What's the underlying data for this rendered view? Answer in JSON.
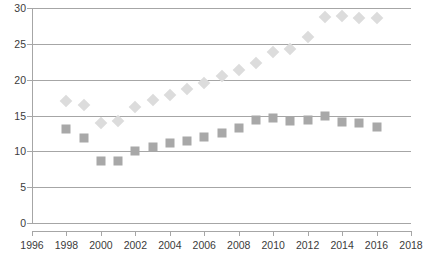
{
  "chart_data": {
    "type": "scatter",
    "title": "",
    "subtitle": "",
    "xlabel": "",
    "ylabel": "",
    "xlim": [
      1996,
      2018
    ],
    "ylim": [
      0,
      30
    ],
    "grid": true,
    "legend_position": "none",
    "x_ticks": [
      1996,
      1998,
      2000,
      2002,
      2004,
      2006,
      2008,
      2010,
      2012,
      2014,
      2016,
      2018
    ],
    "x_tick_labels": [
      "1996",
      "1998",
      "2000",
      "2002",
      "2004",
      "2006",
      "2008",
      "2010",
      "2012",
      "2014",
      "2016",
      "2018"
    ],
    "y_ticks": [
      0,
      5,
      10,
      15,
      20,
      25,
      30
    ],
    "y_tick_labels": [
      "0",
      "5",
      "10",
      "15",
      "20",
      "25",
      "30"
    ],
    "x": [
      1998,
      1999,
      2000,
      2001,
      2002,
      2003,
      2004,
      2005,
      2006,
      2007,
      2008,
      2009,
      2010,
      2011,
      2012,
      2013,
      2014,
      2015,
      2016
    ],
    "series": [
      {
        "name": "upper-series",
        "marker": "diamond",
        "color": "#dcdcdc",
        "values": [
          17.0,
          16.4,
          13.9,
          14.2,
          16.2,
          17.2,
          17.8,
          18.7,
          19.5,
          20.5,
          21.4,
          22.3,
          23.8,
          24.3,
          26.0,
          28.7,
          28.9,
          28.6,
          28.6
        ]
      },
      {
        "name": "lower-series",
        "marker": "square",
        "color": "#a8a8a8",
        "values": [
          13.1,
          11.9,
          8.7,
          8.7,
          10.0,
          10.6,
          11.2,
          11.4,
          12.0,
          12.6,
          13.2,
          14.4,
          14.6,
          14.2,
          14.4,
          14.9,
          14.1,
          14.0,
          13.4
        ]
      }
    ],
    "caption": ""
  }
}
